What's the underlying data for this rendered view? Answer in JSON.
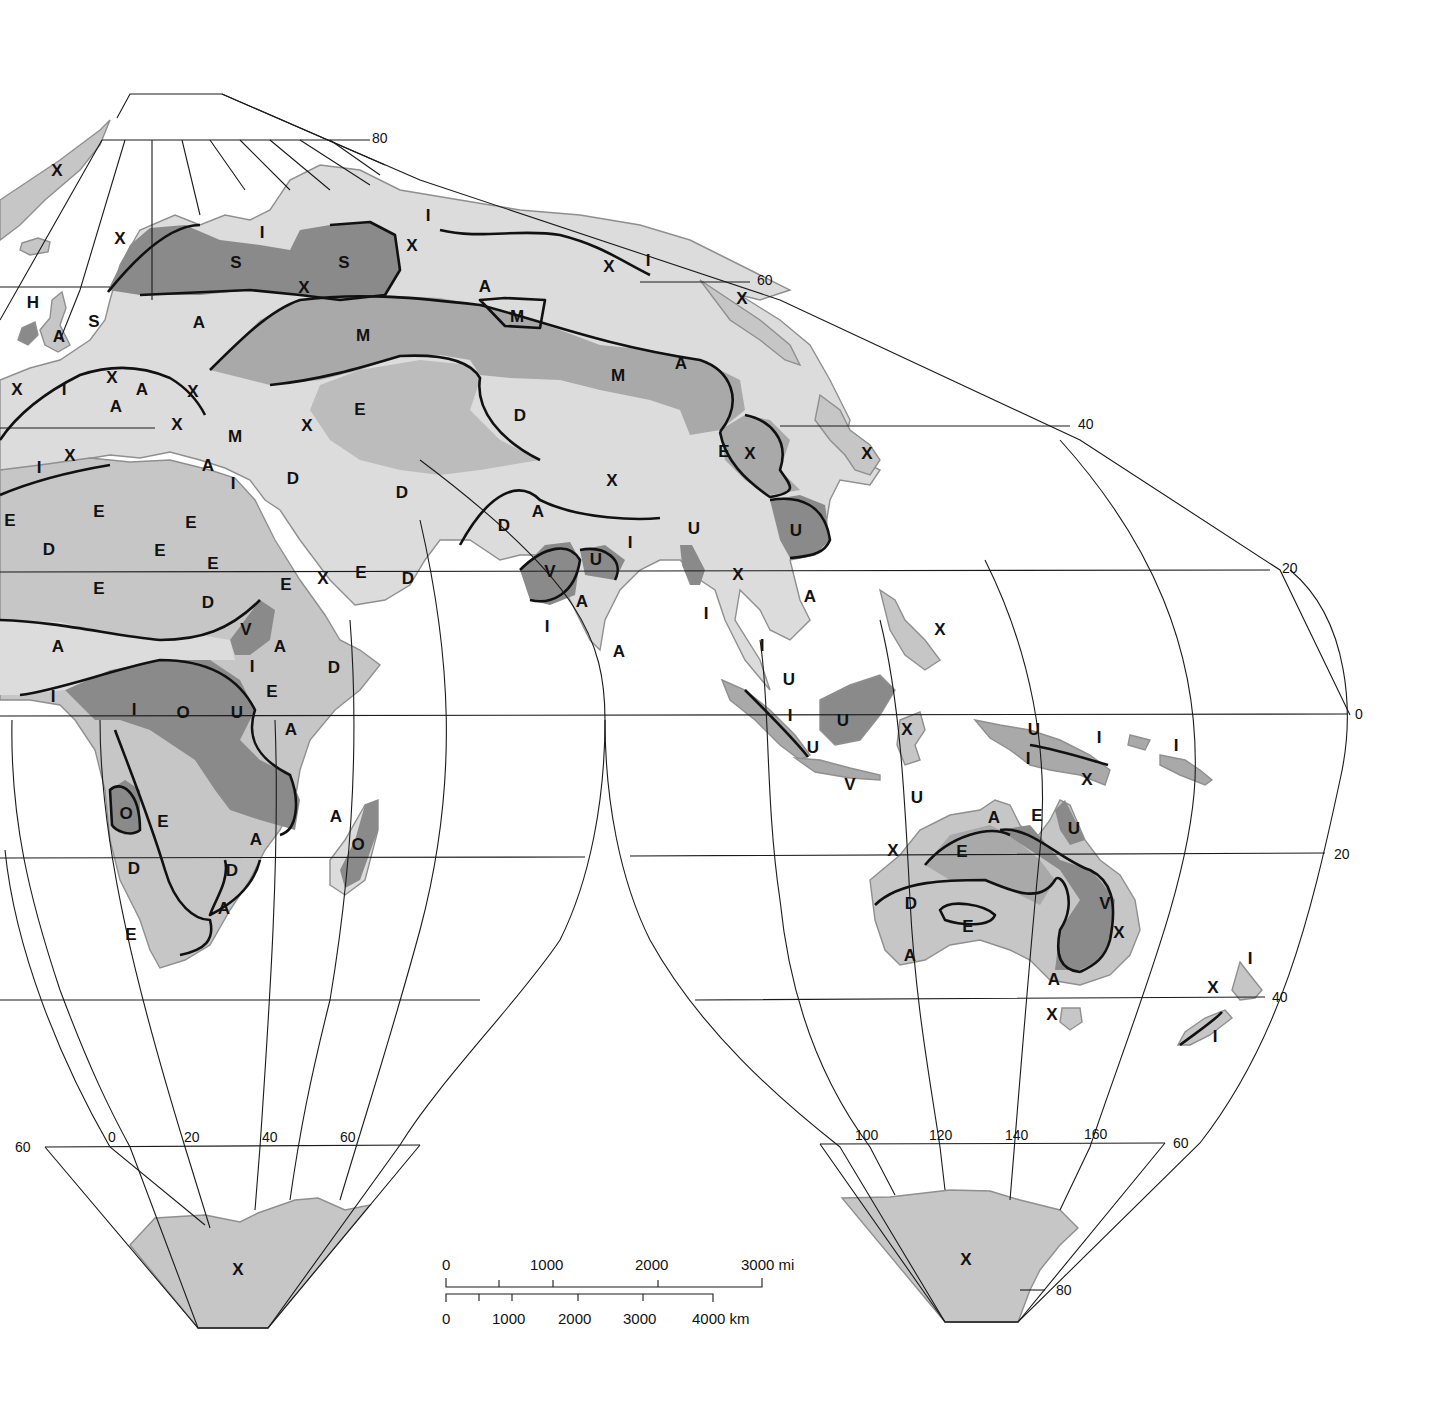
{
  "colors": {
    "ocean": "#ffffff",
    "tone_lightest": "#dcdcdc",
    "tone_light": "#c6c6c6",
    "tone_medium": "#a9a9a9",
    "tone_dark": "#8a8a8a",
    "grid": "#1a1a1a",
    "boundary": "#111111"
  },
  "graticule_labels": {
    "lat_north_80": "80",
    "lat_north_60": "60",
    "lat_north_40": "40",
    "lat_north_20": "20",
    "lat_equator": "0",
    "lat_south_20": "20",
    "lat_south_40": "40",
    "lat_south_60_left": "60",
    "lat_south_60_right": "60",
    "lat_south_80": "80",
    "lon_0": "0",
    "lon_20": "20",
    "lon_40": "40",
    "lon_60": "60",
    "lon_100": "100",
    "lon_120": "120",
    "lon_140": "140",
    "lon_160": "160"
  },
  "scale_bar": {
    "miles": [
      "0",
      "1000",
      "2000",
      "3000 mi"
    ],
    "km": [
      "0",
      "1000",
      "2000",
      "3000",
      "4000 km"
    ]
  },
  "zone_labels": [
    {
      "t": "X",
      "x": 57,
      "y": 172
    },
    {
      "t": "X",
      "x": 120,
      "y": 240
    },
    {
      "t": "I",
      "x": 262,
      "y": 234
    },
    {
      "t": "S",
      "x": 236,
      "y": 264
    },
    {
      "t": "S",
      "x": 344,
      "y": 264
    },
    {
      "t": "X",
      "x": 304,
      "y": 289
    },
    {
      "t": "I",
      "x": 428,
      "y": 217
    },
    {
      "t": "X",
      "x": 412,
      "y": 247
    },
    {
      "t": "A",
      "x": 485,
      "y": 288
    },
    {
      "t": "X",
      "x": 609,
      "y": 268
    },
    {
      "t": "I",
      "x": 648,
      "y": 262
    },
    {
      "t": "X",
      "x": 742,
      "y": 300
    },
    {
      "t": "H",
      "x": 33,
      "y": 304
    },
    {
      "t": "A",
      "x": 59,
      "y": 338
    },
    {
      "t": "S",
      "x": 94,
      "y": 323
    },
    {
      "t": "A",
      "x": 199,
      "y": 324
    },
    {
      "t": "M",
      "x": 363,
      "y": 337
    },
    {
      "t": "M",
      "x": 517,
      "y": 318
    },
    {
      "t": "A",
      "x": 681,
      "y": 365
    },
    {
      "t": "M",
      "x": 618,
      "y": 377
    },
    {
      "t": "X",
      "x": 17,
      "y": 391
    },
    {
      "t": "I",
      "x": 64,
      "y": 391
    },
    {
      "t": "X",
      "x": 112,
      "y": 379
    },
    {
      "t": "A",
      "x": 142,
      "y": 391
    },
    {
      "t": "A",
      "x": 116,
      "y": 408
    },
    {
      "t": "X",
      "x": 193,
      "y": 393
    },
    {
      "t": "X",
      "x": 177,
      "y": 426
    },
    {
      "t": "M",
      "x": 235,
      "y": 438
    },
    {
      "t": "X",
      "x": 307,
      "y": 427
    },
    {
      "t": "E",
      "x": 360,
      "y": 411
    },
    {
      "t": "D",
      "x": 520,
      "y": 417
    },
    {
      "t": "E",
      "x": 724,
      "y": 453
    },
    {
      "t": "X",
      "x": 750,
      "y": 455
    },
    {
      "t": "X",
      "x": 867,
      "y": 455
    },
    {
      "t": "X",
      "x": 70,
      "y": 457
    },
    {
      "t": "I",
      "x": 39,
      "y": 469
    },
    {
      "t": "A",
      "x": 208,
      "y": 467
    },
    {
      "t": "I",
      "x": 233,
      "y": 485
    },
    {
      "t": "D",
      "x": 293,
      "y": 480
    },
    {
      "t": "D",
      "x": 402,
      "y": 494
    },
    {
      "t": "X",
      "x": 612,
      "y": 482
    },
    {
      "t": "E",
      "x": 10,
      "y": 522
    },
    {
      "t": "E",
      "x": 99,
      "y": 513
    },
    {
      "t": "E",
      "x": 191,
      "y": 524
    },
    {
      "t": "D",
      "x": 49,
      "y": 551
    },
    {
      "t": "E",
      "x": 160,
      "y": 552
    },
    {
      "t": "E",
      "x": 213,
      "y": 565
    },
    {
      "t": "D",
      "x": 504,
      "y": 527
    },
    {
      "t": "A",
      "x": 538,
      "y": 513
    },
    {
      "t": "U",
      "x": 694,
      "y": 530
    },
    {
      "t": "U",
      "x": 796,
      "y": 532
    },
    {
      "t": "I",
      "x": 630,
      "y": 544
    },
    {
      "t": "V",
      "x": 550,
      "y": 573
    },
    {
      "t": "U",
      "x": 596,
      "y": 561
    },
    {
      "t": "E",
      "x": 286,
      "y": 586
    },
    {
      "t": "X",
      "x": 323,
      "y": 580
    },
    {
      "t": "E",
      "x": 361,
      "y": 574
    },
    {
      "t": "D",
      "x": 408,
      "y": 580
    },
    {
      "t": "E",
      "x": 99,
      "y": 590
    },
    {
      "t": "D",
      "x": 208,
      "y": 604
    },
    {
      "t": "X",
      "x": 738,
      "y": 576
    },
    {
      "t": "A",
      "x": 582,
      "y": 603
    },
    {
      "t": "A",
      "x": 810,
      "y": 598
    },
    {
      "t": "I",
      "x": 706,
      "y": 615
    },
    {
      "t": "I",
      "x": 547,
      "y": 628
    },
    {
      "t": "X",
      "x": 940,
      "y": 631
    },
    {
      "t": "A",
      "x": 58,
      "y": 648
    },
    {
      "t": "V",
      "x": 246,
      "y": 631
    },
    {
      "t": "A",
      "x": 280,
      "y": 648
    },
    {
      "t": "A",
      "x": 619,
      "y": 653
    },
    {
      "t": "I",
      "x": 762,
      "y": 647
    },
    {
      "t": "I",
      "x": 252,
      "y": 668
    },
    {
      "t": "D",
      "x": 334,
      "y": 669
    },
    {
      "t": "E",
      "x": 272,
      "y": 693
    },
    {
      "t": "U",
      "x": 789,
      "y": 681
    },
    {
      "t": "I",
      "x": 53,
      "y": 698
    },
    {
      "t": "I",
      "x": 134,
      "y": 711
    },
    {
      "t": "O",
      "x": 183,
      "y": 714
    },
    {
      "t": "U",
      "x": 237,
      "y": 714
    },
    {
      "t": "A",
      "x": 291,
      "y": 731
    },
    {
      "t": "I",
      "x": 790,
      "y": 717
    },
    {
      "t": "U",
      "x": 843,
      "y": 722
    },
    {
      "t": "X",
      "x": 907,
      "y": 731
    },
    {
      "t": "U",
      "x": 1034,
      "y": 731
    },
    {
      "t": "I",
      "x": 1099,
      "y": 739
    },
    {
      "t": "I",
      "x": 1176,
      "y": 747
    },
    {
      "t": "I",
      "x": 1028,
      "y": 760
    },
    {
      "t": "X",
      "x": 1087,
      "y": 781
    },
    {
      "t": "U",
      "x": 813,
      "y": 749
    },
    {
      "t": "V",
      "x": 850,
      "y": 786
    },
    {
      "t": "U",
      "x": 917,
      "y": 799
    },
    {
      "t": "O",
      "x": 126,
      "y": 815
    },
    {
      "t": "E",
      "x": 163,
      "y": 823
    },
    {
      "t": "A",
      "x": 336,
      "y": 818
    },
    {
      "t": "O",
      "x": 358,
      "y": 846
    },
    {
      "t": "A",
      "x": 256,
      "y": 841
    },
    {
      "t": "A",
      "x": 994,
      "y": 819
    },
    {
      "t": "E",
      "x": 1037,
      "y": 817
    },
    {
      "t": "U",
      "x": 1074,
      "y": 830
    },
    {
      "t": "X",
      "x": 893,
      "y": 852
    },
    {
      "t": "E",
      "x": 962,
      "y": 853
    },
    {
      "t": "D",
      "x": 134,
      "y": 870
    },
    {
      "t": "D",
      "x": 232,
      "y": 872
    },
    {
      "t": "A",
      "x": 224,
      "y": 910
    },
    {
      "t": "D",
      "x": 911,
      "y": 905
    },
    {
      "t": "V",
      "x": 1105,
      "y": 905
    },
    {
      "t": "E",
      "x": 968,
      "y": 928
    },
    {
      "t": "X",
      "x": 1119,
      "y": 934
    },
    {
      "t": "E",
      "x": 131,
      "y": 936
    },
    {
      "t": "A",
      "x": 910,
      "y": 957
    },
    {
      "t": "A",
      "x": 1054,
      "y": 981
    },
    {
      "t": "I",
      "x": 1250,
      "y": 960
    },
    {
      "t": "X",
      "x": 1213,
      "y": 989
    },
    {
      "t": "X",
      "x": 1052,
      "y": 1016
    },
    {
      "t": "I",
      "x": 1215,
      "y": 1038
    },
    {
      "t": "X",
      "x": 238,
      "y": 1271
    },
    {
      "t": "X",
      "x": 966,
      "y": 1261
    }
  ]
}
